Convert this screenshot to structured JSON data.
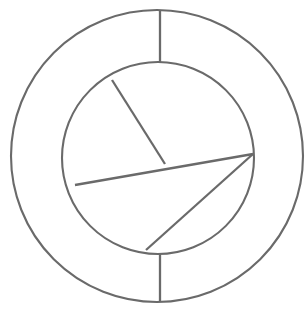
{
  "figure": {
    "background_color": "#ffffff",
    "stroke_color": "#6a6a6a",
    "stroke_width": 2.2,
    "canvas": {
      "width": 308,
      "height": 310
    }
  },
  "chart_data": {
    "type": "pie",
    "categories": [
      "upper-right sector",
      "lower-right sector",
      "lower-left sector",
      "upper-left sector"
    ],
    "values": [
      26,
      22,
      30,
      22
    ],
    "xlabel": "",
    "ylabel": "",
    "legend": "none",
    "grid": false
  },
  "geometry": {
    "outer_circle": {
      "cx": 157,
      "cy": 156,
      "r": 146
    },
    "inner_circle": {
      "cx": 158,
      "cy": 158,
      "r": 96
    },
    "junction_point": {
      "x": 165,
      "y": 164
    },
    "radial_connectors": [
      {
        "name": "top-connector",
        "x1": 160,
        "y1": 10,
        "x2": 160,
        "y2": 62
      },
      {
        "name": "bottom-connector",
        "x1": 160,
        "y1": 254,
        "x2": 160,
        "y2": 302
      }
    ],
    "chords": [
      {
        "name": "upper-left-chord",
        "x1": 112,
        "y1": 80,
        "x2": 165,
        "y2": 164
      },
      {
        "name": "left-horizontal-chord",
        "x1": 75,
        "y1": 185,
        "x2": 253,
        "y2": 154
      },
      {
        "name": "lower-right-diagonal-chord",
        "x1": 253,
        "y1": 154,
        "x2": 146,
        "y2": 250
      }
    ]
  },
  "labels": {
    "visible_text": [],
    "note": "No text, axis ticks, legends, numbers or annotations appear anywhere in this image."
  }
}
